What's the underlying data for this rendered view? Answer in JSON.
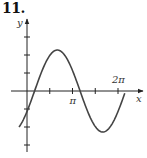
{
  "problem": {
    "number": "11."
  },
  "chart_data": {
    "type": "line",
    "title": "",
    "xlabel": "x",
    "ylabel": "y",
    "x_tick_labels": [
      {
        "label": "π",
        "value": 3.14159
      },
      {
        "label": "2π",
        "value": 6.28319
      }
    ],
    "x_ticks": [
      1.5708,
      3.14159,
      4.7124,
      6.28319
    ],
    "y_ticks": [
      -3,
      -2,
      -1,
      1,
      2,
      3
    ],
    "xlim": [
      -0.6,
      7.0
    ],
    "ylim": [
      -3.3,
      3.9
    ],
    "grid": false,
    "series": [
      {
        "name": "curve",
        "function": "2*sin(x - pi/6)",
        "x_range": [
          -0.55,
          6.75
        ],
        "key_points": [
          {
            "x": 0,
            "y": -1
          },
          {
            "x": 0.5236,
            "y": 0
          },
          {
            "x": 2.0944,
            "y": 2
          },
          {
            "x": 3.6652,
            "y": 0
          },
          {
            "x": 5.236,
            "y": -2
          },
          {
            "x": 6.8068,
            "y": 0
          }
        ]
      }
    ],
    "colors": {
      "axis": "#222222",
      "curve": "#444444"
    }
  }
}
